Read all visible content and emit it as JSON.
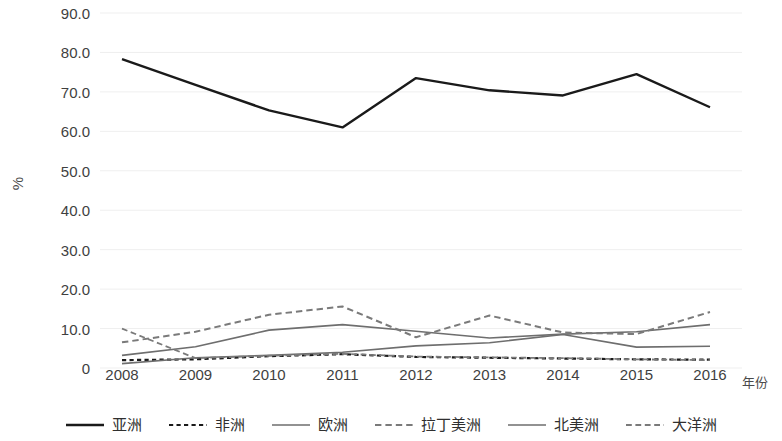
{
  "chart_data": {
    "type": "line",
    "title": "",
    "subtitle": "",
    "xlabel": "年份",
    "ylabel": "%",
    "categories": [
      "2008",
      "2009",
      "2010",
      "2011",
      "2012",
      "2013",
      "2014",
      "2015",
      "2016"
    ],
    "x": [
      2008,
      2009,
      2010,
      2011,
      2012,
      2013,
      2014,
      2015,
      2016
    ],
    "ylim": [
      0,
      90
    ],
    "yticks": [
      "0",
      "10.0",
      "20.0",
      "30.0",
      "40.0",
      "50.0",
      "60.0",
      "70.0",
      "80.0",
      "90.0"
    ],
    "ytick_values": [
      0,
      10,
      20,
      30,
      40,
      50,
      60,
      70,
      80,
      90
    ],
    "grid": true,
    "grid_axis": "y",
    "legend_position": "bottom",
    "series": [
      {
        "name": "亚洲",
        "values": [
          78.3,
          71.8,
          65.3,
          61.0,
          73.5,
          70.4,
          69.1,
          74.5,
          66.1
        ],
        "style": "solid",
        "color": "#1a1a1a",
        "width": 2.4
      },
      {
        "name": "非洲",
        "values": [
          2.0,
          2.2,
          3.0,
          3.5,
          2.8,
          2.6,
          2.4,
          2.2,
          2.1
        ],
        "style": "dotted",
        "color": "#1a1a1a",
        "width": 2.2
      },
      {
        "name": "欧洲",
        "values": [
          3.2,
          5.4,
          9.6,
          11.0,
          9.3,
          7.6,
          8.6,
          9.2,
          11.0
        ],
        "style": "solid",
        "color": "#6e6e6e",
        "width": 1.6
      },
      {
        "name": "拉丁美洲",
        "values": [
          6.5,
          9.2,
          13.5,
          15.6,
          7.8,
          13.3,
          9.0,
          8.6,
          14.2
        ],
        "style": "dashed",
        "color": "#7a7a7a",
        "width": 2.0
      },
      {
        "name": "北美洲",
        "values": [
          1.1,
          2.6,
          3.2,
          4.0,
          5.6,
          6.4,
          8.5,
          5.3,
          5.5
        ],
        "style": "solid",
        "color": "#6e6e6e",
        "width": 1.6
      },
      {
        "name": "大洋洲",
        "values": [
          10.0,
          2.5,
          3.1,
          3.6,
          2.9,
          2.7,
          2.5,
          2.2,
          2.0
        ],
        "style": "dashed",
        "color": "#7a7a7a",
        "width": 1.8
      }
    ]
  },
  "axes": {
    "y_label": "%",
    "x_label": "年份"
  },
  "legend": {
    "items": [
      {
        "label": "亚洲"
      },
      {
        "label": "非洲"
      },
      {
        "label": "欧洲"
      },
      {
        "label": "拉丁美洲"
      },
      {
        "label": "北美洲"
      },
      {
        "label": "大洋洲"
      }
    ]
  },
  "colors": {
    "background": "#ffffff",
    "gridline": "#efefef",
    "axis_text": "#3f3f3f",
    "series_dark": "#1a1a1a",
    "series_gray": "#6e6e6e"
  }
}
